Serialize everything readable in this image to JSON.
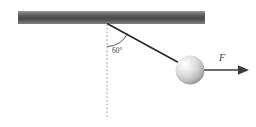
{
  "figure": {
    "background_color": "#ffffff",
    "width": 256,
    "height": 127
  },
  "ceiling": {
    "name": "ceiling-bar",
    "x": 18,
    "y": 11,
    "width": 187,
    "height": 13,
    "color_top": "#8f8f8f",
    "color_mid": "#4e4e4e",
    "color_bottom": "#7a7a7a"
  },
  "pivot": {
    "name": "pivot-point",
    "x": 108,
    "y": 24
  },
  "reference_line": {
    "name": "vertical-dashed-reference",
    "x": 107,
    "y_start": 24,
    "y_end": 117,
    "color": "#8a8a8a",
    "dash": "1.6 2.2"
  },
  "string": {
    "name": "pendulum-string",
    "x1": 108,
    "y1": 24,
    "x2": 182,
    "y2": 64,
    "color": "#2b2b2b",
    "width": 1.6
  },
  "angle": {
    "name": "angle-arc",
    "label": "60°",
    "value": 60,
    "unit": "degrees",
    "radius": 22,
    "label_x": 112,
    "label_y": 52,
    "color": "#4a4a4a"
  },
  "ball": {
    "name": "pendulum-bob",
    "cx": 190,
    "cy": 70,
    "r": 14.5,
    "highlight_color": "#fdfdfd",
    "mid_color": "#d2d2d2",
    "edge_color": "#8d8d8d"
  },
  "force_arrow": {
    "name": "force-vector",
    "label": "F",
    "x_start": 199,
    "x_end": 249,
    "y": 70,
    "head_length": 10,
    "head_width": 9,
    "color": "#3d3d3d",
    "label_x": 221,
    "label_y": 60
  }
}
